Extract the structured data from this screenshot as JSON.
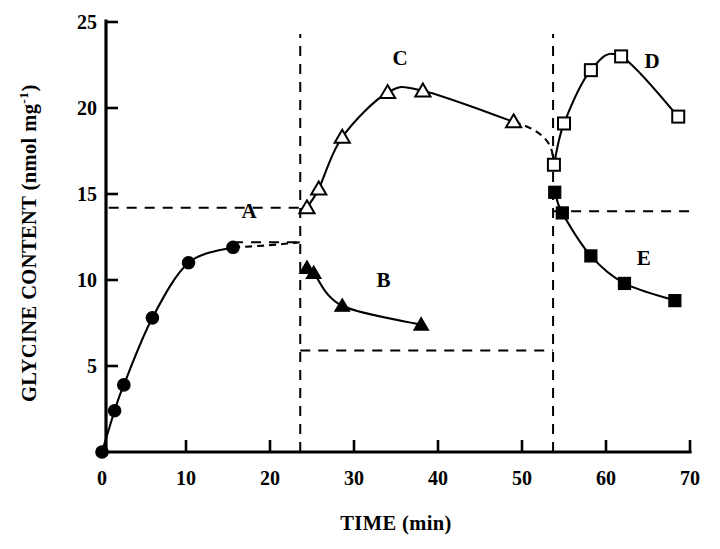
{
  "chart_data": {
    "type": "line",
    "title": "",
    "xlabel": "TIME (min)",
    "ylabel": "GLYCINE CONTENT (nmol mg",
    "ylabel_superscript": "-1",
    "ylabel_suffix": ")",
    "xlim": [
      0,
      70
    ],
    "ylim": [
      0,
      25
    ],
    "xticks": [
      0,
      10,
      20,
      30,
      40,
      50,
      60,
      70
    ],
    "yticks": [
      0,
      5,
      10,
      15,
      20,
      25
    ],
    "xtick_labels": [
      "0",
      "10",
      "20",
      "30",
      "40",
      "50",
      "60",
      "70"
    ],
    "ytick_labels": [
      "0",
      "5",
      "10",
      "15",
      "20",
      "25"
    ],
    "grid": false,
    "legend": "inline-curve-labels",
    "series": [
      {
        "name": "A",
        "label": "A",
        "marker": "filled-circle",
        "label_x": 17.5,
        "label_y": 13.6,
        "x": [
          0,
          1.5,
          2.6,
          6.0,
          10.3,
          15.6
        ],
        "y": [
          0.0,
          2.4,
          3.9,
          7.8,
          11.0,
          11.9
        ],
        "dashed_extension_to_x": 23.6,
        "dashed_extension_to_y": 12.2
      },
      {
        "name": "B",
        "label": "B",
        "marker": "filled-triangle",
        "label_x": 33.5,
        "label_y": 9.6,
        "x": [
          24.4,
          25.2,
          28.6,
          38.0
        ],
        "y": [
          10.7,
          10.4,
          8.5,
          7.4
        ]
      },
      {
        "name": "C",
        "label": "C",
        "marker": "open-triangle",
        "label_x": 35.5,
        "label_y": 22.5,
        "x": [
          24.4,
          25.8,
          28.6,
          34.0,
          38.2,
          49.0
        ],
        "y": [
          14.2,
          15.3,
          18.3,
          20.9,
          21.0,
          19.2
        ],
        "dashed_extension_to_x": 53.6,
        "dashed_extension_to_y": 16.7
      },
      {
        "name": "D",
        "label": "D",
        "marker": "open-square",
        "label_x": 65.5,
        "label_y": 22.3,
        "x": [
          53.8,
          55.0,
          58.2,
          61.8,
          68.6
        ],
        "y": [
          16.7,
          19.1,
          22.2,
          23.0,
          19.5
        ]
      },
      {
        "name": "E",
        "label": "E",
        "marker": "filled-square",
        "label_x": 64.5,
        "label_y": 10.9,
        "x": [
          53.9,
          54.8,
          58.2,
          62.2,
          68.2
        ],
        "y": [
          15.1,
          13.9,
          11.4,
          9.8,
          8.8
        ]
      }
    ],
    "guide_lines": [
      {
        "name": "vertical-divider-1",
        "orientation": "vertical",
        "x": 23.6,
        "y_from": 0.0,
        "y_to": 24.3
      },
      {
        "name": "vertical-divider-2",
        "orientation": "vertical",
        "x": 53.7,
        "y_from": 0.0,
        "y_to": 24.3
      },
      {
        "name": "horizontal-upper-left",
        "orientation": "horizontal",
        "y": 14.2,
        "x_from": 0.8,
        "x_to": 23.6
      },
      {
        "name": "horizontal-upper-right",
        "orientation": "horizontal",
        "y": 14.0,
        "x_from": 53.7,
        "x_to": 70.0
      },
      {
        "name": "horizontal-curve-a-plateau",
        "orientation": "horizontal",
        "y": 12.2,
        "x_from": 15.6,
        "x_to": 23.6
      },
      {
        "name": "horizontal-lower-middle",
        "orientation": "horizontal",
        "y": 5.9,
        "x_from": 23.6,
        "x_to": 53.7
      }
    ]
  }
}
